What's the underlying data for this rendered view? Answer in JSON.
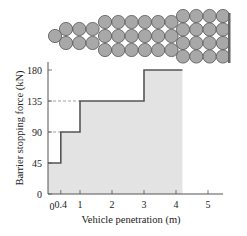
{
  "chart_data": {
    "type": "step",
    "title": "",
    "xlabel": "Vehicle penetration (m)",
    "ylabel": "Barrier stopping force (kN)",
    "xlim": [
      0,
      5.5
    ],
    "ylim": [
      0,
      180
    ],
    "x_ticks": [
      "0.4",
      "1",
      "2",
      "3",
      "4",
      "5"
    ],
    "x_tick_values": [
      0.4,
      1,
      2,
      3,
      4,
      5
    ],
    "y_ticks": [
      "0",
      "45",
      "90",
      "135",
      "180"
    ],
    "y_tick_values": [
      0,
      45,
      90,
      135,
      180
    ],
    "x_origin_label": "0",
    "steps": [
      {
        "x_start": 0,
        "x_end": 0.4,
        "force": 45
      },
      {
        "x_start": 0.4,
        "x_end": 1,
        "force": 90
      },
      {
        "x_start": 1,
        "x_end": 3,
        "force": 135
      },
      {
        "x_start": 3,
        "x_end": 4.2,
        "force": 180
      }
    ],
    "reference_lines": [
      90,
      135
    ],
    "fill_color": "#e3e3e3",
    "line_color": "#555555",
    "grid": false
  },
  "illustration": {
    "description": "Barrel crash barrier array viewed from above",
    "barrel_color": "#a8a8a8",
    "barrel_stroke": "#555555",
    "wall_color": "#666666"
  }
}
